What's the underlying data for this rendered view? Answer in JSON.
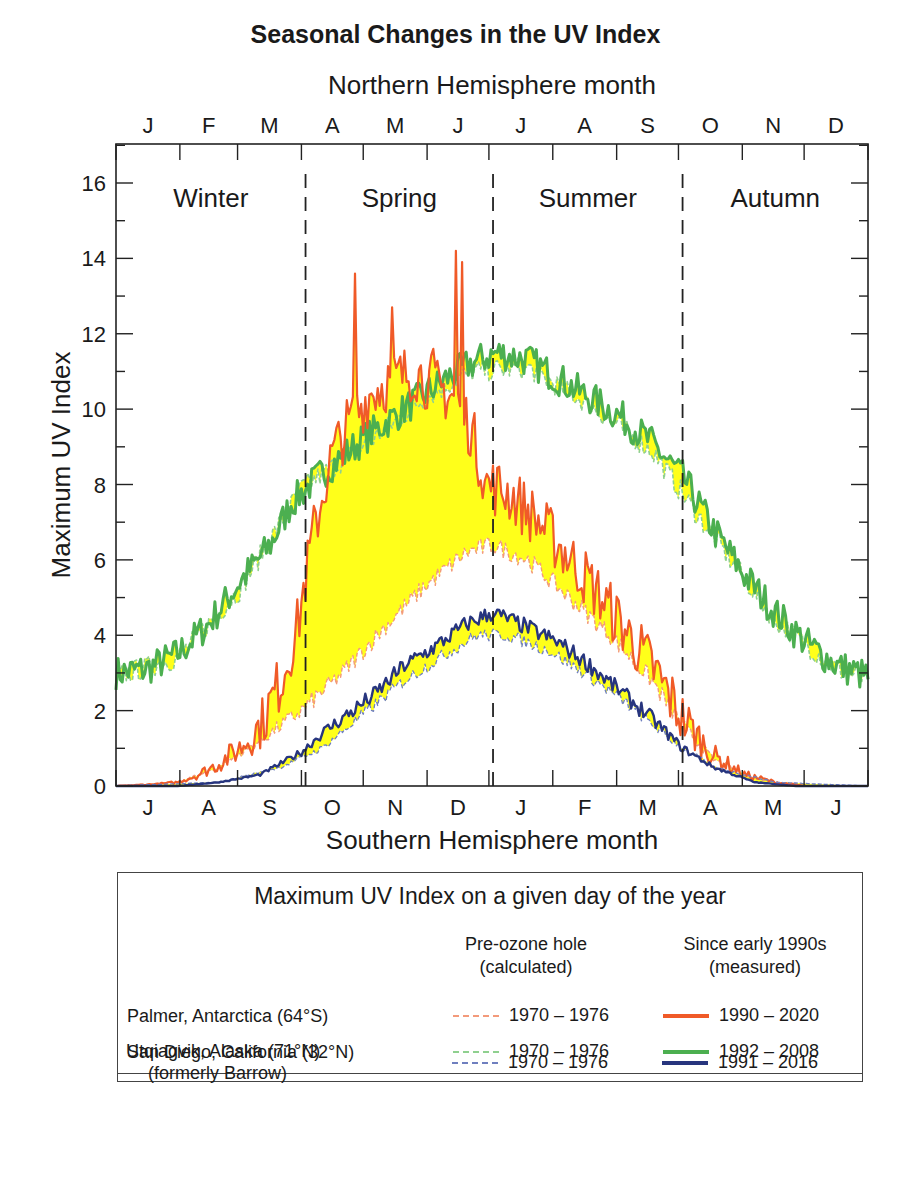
{
  "title": "Seasonal Changes in the UV Index",
  "top_axis_label": "Northern Hemisphere month",
  "bottom_axis_label": "Southern Hemisphere month",
  "y_axis_label": "Maximum UV Index",
  "colors": {
    "palmer": "#f05a28",
    "palmer_pre": "#f39a7a",
    "san_diego": "#4caf50",
    "san_diego_pre": "#8fd08f",
    "utqiagvik": "#27357e",
    "utqiagvik_pre": "#6f7fbf",
    "fill": "#ffff1a",
    "axis": "#222222"
  },
  "legend": {
    "title": "Maximum UV Index on a given day of the year",
    "col1_head_line1": "Pre-ozone hole",
    "col1_head_line2": "(calculated)",
    "col2_head_line1": "Since early 1990s",
    "col2_head_line2": "(measured)",
    "rows": [
      {
        "label": "Palmer, Antarctica (64°S)",
        "sublabel": "",
        "pre": "1970 – 1976",
        "measured": "1990 – 2020"
      },
      {
        "label": "San Diego, California (32°N)",
        "sublabel": "",
        "pre": "1970 – 1976",
        "measured": "1992 – 2008"
      },
      {
        "label": "Utqiagvik, Alaska (71°N)",
        "sublabel": "(formerly Barrow)",
        "pre": "1970 – 1976",
        "measured": "1991 – 2016"
      }
    ]
  },
  "chart_data": {
    "type": "line",
    "title": "Seasonal Changes in the UV Index",
    "xlabel_top": "Northern Hemisphere month",
    "xlabel_bottom": "Southern Hemisphere month",
    "ylabel": "Maximum UV Index",
    "ylim": [
      0,
      17
    ],
    "yticks": [
      0,
      2,
      4,
      6,
      8,
      10,
      12,
      14,
      16
    ],
    "xlim_days": [
      0,
      365
    ],
    "top_month_ticks": [
      "J",
      "F",
      "M",
      "A",
      "M",
      "J",
      "J",
      "A",
      "S",
      "O",
      "N",
      "D"
    ],
    "bottom_month_ticks": [
      "J",
      "A",
      "S",
      "O",
      "N",
      "D",
      "J",
      "F",
      "M",
      "A",
      "M",
      "J"
    ],
    "season_dividers_day": [
      92,
      183,
      275
    ],
    "season_labels": [
      "Winter",
      "Spring",
      "Summer",
      "Autumn"
    ],
    "grid": false,
    "series": [
      {
        "name": "San Diego measured 1992–2008",
        "style": "solid",
        "color_key": "san_diego",
        "days": [
          0,
          15,
          30,
          45,
          60,
          75,
          85,
          100,
          120,
          140,
          160,
          172,
          185,
          200,
          215,
          230,
          245,
          260,
          275,
          290,
          305,
          320,
          335,
          350,
          365
        ],
        "values": [
          3.0,
          3.1,
          3.5,
          4.3,
          5.4,
          6.4,
          7.5,
          8.3,
          9.2,
          10.0,
          10.8,
          11.2,
          11.5,
          11.3,
          10.8,
          10.3,
          9.8,
          9.1,
          8.2,
          6.8,
          5.6,
          4.6,
          3.8,
          3.2,
          2.9
        ]
      },
      {
        "name": "San Diego pre-ozone 1970–1976",
        "style": "dashed",
        "color_key": "san_diego_pre",
        "days": [
          0,
          30,
          60,
          90,
          120,
          150,
          172,
          200,
          230,
          260,
          290,
          320,
          350,
          365
        ],
        "values": [
          2.9,
          3.4,
          5.2,
          7.9,
          9.0,
          10.3,
          11.0,
          11.1,
          10.1,
          8.9,
          6.6,
          4.4,
          3.1,
          2.8
        ]
      },
      {
        "name": "Palmer measured 1990–2020",
        "style": "solid",
        "color_key": "palmer",
        "days": [
          0,
          20,
          30,
          40,
          50,
          60,
          70,
          80,
          88,
          95,
          105,
          115,
          125,
          135,
          145,
          155,
          165,
          172,
          180,
          190,
          200,
          215,
          230,
          245,
          260,
          275,
          290,
          305,
          320,
          335,
          350,
          365
        ],
        "values": [
          0.0,
          0.05,
          0.1,
          0.3,
          0.6,
          1.0,
          1.6,
          2.8,
          4.2,
          6.5,
          8.8,
          9.8,
          10.5,
          10.8,
          11.0,
          10.6,
          10.3,
          9.5,
          8.0,
          7.8,
          7.3,
          6.4,
          5.4,
          4.3,
          3.2,
          1.8,
          0.8,
          0.3,
          0.1,
          0.0,
          0.0,
          0.0
        ]
      },
      {
        "name": "Palmer pre-ozone 1970–1976",
        "style": "dashed",
        "color_key": "palmer_pre",
        "days": [
          0,
          30,
          50,
          70,
          90,
          110,
          130,
          150,
          170,
          183,
          200,
          220,
          240,
          260,
          275,
          290,
          310,
          330,
          365
        ],
        "values": [
          0.0,
          0.1,
          0.5,
          1.2,
          2.0,
          3.0,
          4.2,
          5.3,
          6.2,
          6.4,
          6.0,
          5.0,
          4.0,
          2.8,
          1.6,
          0.7,
          0.2,
          0.0,
          0.0
        ]
      },
      {
        "name": "Utqiagvik measured 1991–2016",
        "style": "solid",
        "color_key": "utqiagvik",
        "days": [
          0,
          30,
          50,
          70,
          90,
          100,
          110,
          125,
          140,
          155,
          170,
          183,
          200,
          215,
          230,
          245,
          260,
          275,
          290,
          310,
          330,
          365
        ],
        "values": [
          0.0,
          0.0,
          0.1,
          0.3,
          0.9,
          1.4,
          1.8,
          2.4,
          3.2,
          3.7,
          4.3,
          4.6,
          4.2,
          3.8,
          3.2,
          2.5,
          1.8,
          1.0,
          0.5,
          0.1,
          0.0,
          0.0
        ]
      },
      {
        "name": "Utqiagvik pre-ozone 1970–1976",
        "style": "dashed",
        "color_key": "utqiagvik_pre",
        "days": [
          0,
          50,
          80,
          100,
          120,
          140,
          160,
          175,
          190,
          210,
          230,
          250,
          270,
          290,
          320,
          365
        ],
        "values": [
          0.0,
          0.1,
          0.5,
          1.0,
          1.9,
          2.8,
          3.5,
          4.0,
          4.0,
          3.6,
          2.9,
          2.1,
          1.2,
          0.5,
          0.1,
          0.0
        ]
      }
    ],
    "annotations": {
      "palmer_spikes": [
        {
          "day": 116,
          "value": 13.6
        },
        {
          "day": 165,
          "value": 14.2
        },
        {
          "day": 168,
          "value": 13.9
        },
        {
          "day": 134,
          "value": 12.7
        },
        {
          "day": 154,
          "value": 11.6
        }
      ],
      "yellow_fill": "area between pre-ozone and measured curves"
    }
  }
}
